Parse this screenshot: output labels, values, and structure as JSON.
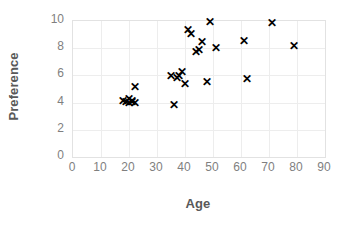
{
  "chart_data": {
    "type": "scatter",
    "title": "",
    "xlabel": "Age",
    "ylabel": "Preference",
    "xlim": [
      0,
      90
    ],
    "ylim": [
      0,
      10
    ],
    "xticks": [
      0,
      10,
      20,
      30,
      40,
      50,
      60,
      70,
      80,
      90
    ],
    "yticks": [
      0,
      2,
      4,
      6,
      8,
      10
    ],
    "grid": true,
    "legend": null,
    "marker": "x",
    "marker_color": "#000000",
    "series": [
      {
        "name": "Age vs Preference",
        "points": [
          {
            "x": 18,
            "y": 4.1
          },
          {
            "x": 19,
            "y": 4.0
          },
          {
            "x": 20,
            "y": 3.9
          },
          {
            "x": 20,
            "y": 4.2
          },
          {
            "x": 21,
            "y": 4.0
          },
          {
            "x": 21,
            "y": 4.1
          },
          {
            "x": 22,
            "y": 3.9
          },
          {
            "x": 22,
            "y": 5.1
          },
          {
            "x": 35,
            "y": 5.9
          },
          {
            "x": 36,
            "y": 3.8
          },
          {
            "x": 37,
            "y": 5.8
          },
          {
            "x": 38,
            "y": 5.9
          },
          {
            "x": 39,
            "y": 6.2
          },
          {
            "x": 40,
            "y": 5.3
          },
          {
            "x": 41,
            "y": 9.3
          },
          {
            "x": 42,
            "y": 9.0
          },
          {
            "x": 44,
            "y": 7.7
          },
          {
            "x": 45,
            "y": 7.8
          },
          {
            "x": 46,
            "y": 8.4
          },
          {
            "x": 48,
            "y": 5.5
          },
          {
            "x": 49,
            "y": 9.9
          },
          {
            "x": 51,
            "y": 8.0
          },
          {
            "x": 61,
            "y": 8.5
          },
          {
            "x": 62,
            "y": 5.7
          },
          {
            "x": 71,
            "y": 9.8
          },
          {
            "x": 79,
            "y": 8.1
          }
        ]
      }
    ]
  },
  "axes": {
    "x": {
      "label": "Age",
      "tick_labels": [
        "0",
        "10",
        "20",
        "30",
        "40",
        "50",
        "60",
        "70",
        "80",
        "90"
      ]
    },
    "y": {
      "label": "Preference",
      "tick_labels": [
        "0",
        "2",
        "4",
        "6",
        "8",
        "10"
      ]
    }
  },
  "style": {
    "background": "#ffffff",
    "grid_color": "#ededed",
    "border_color": "#e2e2e2",
    "tick_label_color": "#7f7f7f",
    "axis_title_color": "#595959",
    "marker_color": "#000000",
    "marker_glyph": "✕"
  }
}
